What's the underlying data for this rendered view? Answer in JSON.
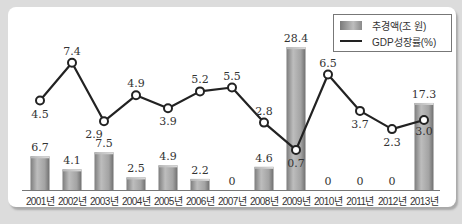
{
  "chart_data": {
    "type": "bar",
    "title": "",
    "xlabel": "",
    "ylabel": "",
    "categories": [
      "2001년",
      "2002년",
      "2003년",
      "2004년",
      "2005년",
      "2006년",
      "2007년",
      "2008년",
      "2009년",
      "2010년",
      "2011년",
      "2012년",
      "2013년"
    ],
    "series": [
      {
        "name": "추경액(조 원)",
        "type": "bar",
        "values": [
          6.7,
          4.1,
          7.5,
          2.5,
          4.9,
          2.2,
          0,
          4.6,
          28.4,
          0,
          0,
          0,
          17.3
        ],
        "labels": [
          "6.7",
          "4.1",
          "7.5",
          "2.5",
          "4.9",
          "2.2",
          "0",
          "4.6",
          "28.4",
          "0",
          "0",
          "0",
          "17.3"
        ]
      },
      {
        "name": "GDP성장률(%)",
        "type": "line",
        "values": [
          4.5,
          7.4,
          2.9,
          4.9,
          3.9,
          5.2,
          5.5,
          2.8,
          0.7,
          6.5,
          3.7,
          2.3,
          3.0
        ],
        "labels": [
          "4.5",
          "7.4",
          "2.9",
          "4.9",
          "3.9",
          "5.2",
          "5.5",
          "2.8",
          "0.7",
          "6.5",
          "3.7",
          "2.3",
          "3.0"
        ]
      }
    ],
    "legend": {
      "position": "top-right",
      "entries": [
        "추경액(조 원)",
        "GDP성장률(%)"
      ]
    },
    "grid": false,
    "colors": {
      "bar": "#a0a0a0",
      "line": "#222222",
      "marker_fill": "#ffffff",
      "background": "#ffffff",
      "page": "#dcdcdc"
    }
  }
}
